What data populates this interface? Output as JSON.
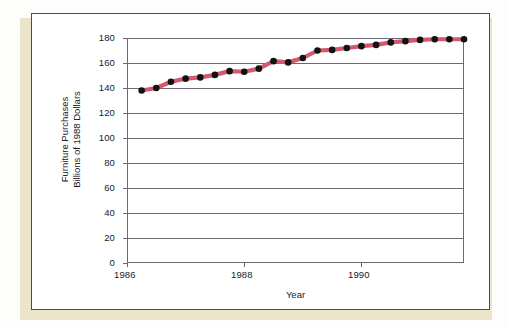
{
  "figure": {
    "card_label": "chart-card",
    "background_color": "#ffffff",
    "shadow_color": "#ece4c8",
    "border_color": "#4a4a52"
  },
  "chart_data": {
    "type": "line",
    "title": "",
    "xlabel": "Year",
    "ylabel": "Furniture Purchases Billions of 1988 Dollars",
    "ylabel_lines": [
      "Furniture Purchases",
      "Billions of 1988 Dollars"
    ],
    "xlim": [
      1986.0,
      1991.75
    ],
    "ylim": [
      0,
      180
    ],
    "ytick_values": [
      0,
      20,
      40,
      60,
      80,
      100,
      120,
      140,
      160,
      180
    ],
    "ytick_labels": [
      "0",
      "20",
      "40",
      "60",
      "80",
      "100",
      "120",
      "140",
      "160",
      "180"
    ],
    "xtick_values": [
      1986,
      1988,
      1990
    ],
    "xtick_labels": [
      "1986",
      "1988",
      "1990"
    ],
    "grid": "horizontal",
    "legend": "none",
    "line_color": "#d4596e",
    "marker_color": "#121216",
    "marker_shape": "circle",
    "axis_color": "#6a6a72",
    "x": [
      1986.25,
      1986.5,
      1986.75,
      1987.0,
      1987.25,
      1987.5,
      1987.75,
      1988.0,
      1988.25,
      1988.5,
      1988.75,
      1989.0,
      1989.25,
      1989.5,
      1989.75,
      1990.0,
      1990.25,
      1990.5,
      1990.75,
      1991.0,
      1991.25,
      1991.5,
      1991.75
    ],
    "values": [
      138,
      140,
      145,
      147.5,
      148.5,
      150.5,
      153.5,
      153,
      155.5,
      161.5,
      160.5,
      164,
      170,
      170.5,
      172,
      173.5,
      174.5,
      176.5,
      177.5,
      178.5,
      179,
      179,
      179
    ],
    "series": [
      {
        "name": "Furniture Purchases",
        "values": [
          138,
          140,
          145,
          147.5,
          148.5,
          150.5,
          153.5,
          153,
          155.5,
          161.5,
          160.5,
          164,
          170,
          170.5,
          172,
          173.5,
          174.5,
          176.5,
          177.5,
          178.5,
          179,
          179,
          179
        ]
      }
    ]
  }
}
